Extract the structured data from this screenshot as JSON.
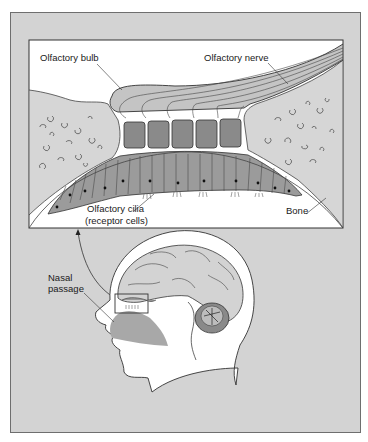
{
  "figure": {
    "type": "anatomical-diagram"
  },
  "inset_labels": {
    "olfactory_bulb": "Olfactory bulb",
    "olfactory_nerve": "Olfactory nerve",
    "olfactory_cilia_line1": "Olfactory cilia",
    "olfactory_cilia_line2": "(receptor cells)",
    "bone": "Bone"
  },
  "head_labels": {
    "nasal_passage_line1": "Nasal",
    "nasal_passage_line2": "passage"
  },
  "colors": {
    "panel_bg": "#d3d3d3",
    "inset_bg": "#ffffff",
    "bone_fill": "#d6d6d6",
    "bulb_fill": "#c4c4c4",
    "glomeruli_fill": "#8a8a8a",
    "receptor_fill": "#9b9b9b",
    "nasal_fill": "#a8a8a8",
    "stroke": "#333333"
  }
}
